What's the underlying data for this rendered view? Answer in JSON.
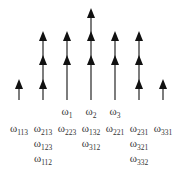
{
  "diagram": {
    "type": "arrow-stack-diagram",
    "stroke_color": "#111111",
    "baseline_y": 100,
    "columns": [
      {
        "x": 19,
        "arrowheads_y": [
          84
        ]
      },
      {
        "x": 43,
        "arrowheads_y": [
          36,
          60,
          84
        ]
      },
      {
        "x": 67,
        "arrowheads_y": [
          36,
          60
        ]
      },
      {
        "x": 91,
        "arrowheads_y": [
          13,
          36,
          60
        ]
      },
      {
        "x": 115,
        "arrowheads_y": [
          36,
          60
        ]
      },
      {
        "x": 139,
        "arrowheads_y": [
          36,
          60,
          84
        ]
      },
      {
        "x": 163,
        "arrowheads_y": [
          84
        ]
      }
    ]
  },
  "labels": [
    {
      "base": "ω",
      "sub": "1",
      "x": 67,
      "y": 114
    },
    {
      "base": "ω",
      "sub": "2",
      "x": 91,
      "y": 114
    },
    {
      "base": "ω",
      "sub": "3",
      "x": 115,
      "y": 114
    },
    {
      "base": "ω",
      "sub": "113",
      "x": 19,
      "y": 131
    },
    {
      "base": "ω",
      "sub": "213",
      "x": 43,
      "y": 131
    },
    {
      "base": "ω",
      "sub": "223",
      "x": 67,
      "y": 131
    },
    {
      "base": "ω",
      "sub": "132",
      "x": 91,
      "y": 131
    },
    {
      "base": "ω",
      "sub": "221",
      "x": 115,
      "y": 131
    },
    {
      "base": "ω",
      "sub": "231",
      "x": 139,
      "y": 131
    },
    {
      "base": "ω",
      "sub": "331",
      "x": 163,
      "y": 131
    },
    {
      "base": "ω",
      "sub": "123",
      "x": 43,
      "y": 146
    },
    {
      "base": "ω",
      "sub": "312",
      "x": 91,
      "y": 146
    },
    {
      "base": "ω",
      "sub": "321",
      "x": 139,
      "y": 146
    },
    {
      "base": "ω",
      "sub": "112",
      "x": 43,
      "y": 161
    },
    {
      "base": "ω",
      "sub": "332",
      "x": 139,
      "y": 161
    }
  ]
}
